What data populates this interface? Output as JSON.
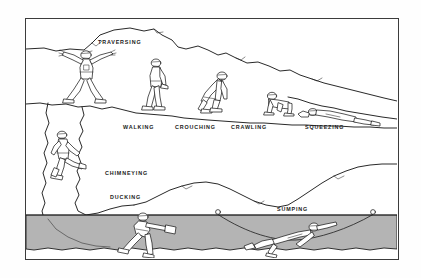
{
  "figure": {
    "border_color": "#3c3c3c",
    "ink_color": "#1d1d1d",
    "background_color": "#ffffff",
    "water_color": "#b4b4b4"
  },
  "labels": {
    "traversing": "TRAVERSING",
    "walking": "WALKING",
    "crouching": "CROUCHING",
    "crawling": "CRAWLING",
    "squeezing": "SQUEEZING",
    "chimneying": "CHIMNEYING",
    "ducking": "DUCKING",
    "sumping": "SUMPING"
  },
  "techniques": [
    {
      "name": "TRAVERSING",
      "tier": "upper",
      "x": 95,
      "y": 40
    },
    {
      "name": "WALKING",
      "tier": "upper",
      "x": 137,
      "y": 126
    },
    {
      "name": "CROUCHING",
      "tier": "upper",
      "x": 190,
      "y": 126
    },
    {
      "name": "CRAWLING",
      "tier": "upper",
      "x": 247,
      "y": 126
    },
    {
      "name": "SQUEEZING",
      "tier": "upper",
      "x": 323,
      "y": 126
    },
    {
      "name": "CHIMNEYING",
      "tier": "lower",
      "x": 129,
      "y": 172
    },
    {
      "name": "DUCKING",
      "tier": "lower",
      "x": 126,
      "y": 196
    },
    {
      "name": "SUMPING",
      "tier": "lower",
      "x": 293,
      "y": 210
    }
  ]
}
